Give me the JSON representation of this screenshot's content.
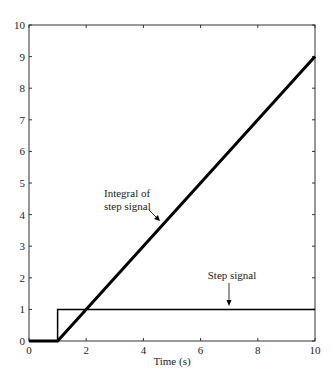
{
  "chart_data": {
    "type": "line",
    "title": "",
    "xlabel": "Time (s)",
    "ylabel": "",
    "xlim": [
      0,
      10
    ],
    "ylim": [
      0,
      10
    ],
    "xticks": [
      0,
      2,
      4,
      6,
      8,
      10
    ],
    "yticks": [
      0,
      1,
      2,
      3,
      4,
      5,
      6,
      7,
      8,
      9,
      10
    ],
    "grid": false,
    "legend": null,
    "series": [
      {
        "name": "Step signal",
        "style": "thin",
        "x": [
          0,
          1,
          1,
          10
        ],
        "y": [
          0,
          0,
          1,
          1
        ]
      },
      {
        "name": "Integral of step signal",
        "style": "thick",
        "x": [
          0,
          1,
          10
        ],
        "y": [
          0,
          0,
          9
        ]
      }
    ],
    "annotations": [
      {
        "text_lines": [
          "Integral of",
          "step signal"
        ],
        "points_to": {
          "x": 4.3,
          "y": 3.3
        }
      },
      {
        "text_lines": [
          "Step signal"
        ],
        "points_to": {
          "x": 7.5,
          "y": 1
        }
      }
    ]
  }
}
